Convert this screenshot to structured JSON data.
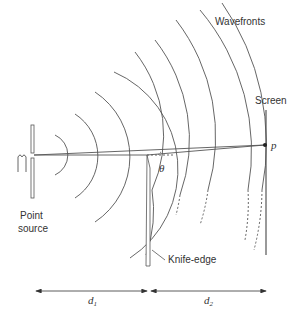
{
  "diagram": {
    "type": "knife-edge diffraction geometry",
    "labels": {
      "wavefronts": "Wavefronts",
      "screen": "Screen",
      "point": "p",
      "point_source_line1": "Point",
      "point_source_line2": "source",
      "knife_edge": "Knife-edge",
      "angle": "θ",
      "d1": "d",
      "d1_sub": "1",
      "d2": "d",
      "d2_sub": "2"
    },
    "colors": {
      "line": "#555555",
      "text": "#333333",
      "background": "#ffffff"
    }
  }
}
